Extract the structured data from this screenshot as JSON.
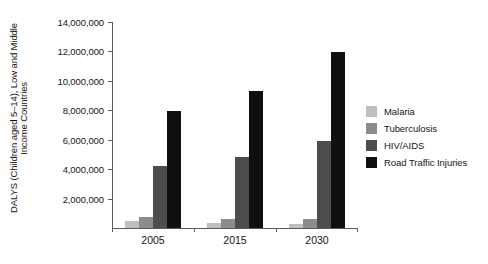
{
  "chart_data": {
    "type": "bar",
    "title": "",
    "xlabel": "",
    "ylabel_lines": [
      "DALYS (Children aged 5–14), Low and Middle",
      "Income Countries"
    ],
    "categories": [
      "2005",
      "2015",
      "2030"
    ],
    "series": [
      {
        "name": "Malaria",
        "color": "#bfbfbf",
        "values": [
          450000,
          330000,
          250000
        ]
      },
      {
        "name": "Tuberculosis",
        "color": "#8c8c8c",
        "values": [
          760000,
          640000,
          620000
        ]
      },
      {
        "name": "HIV/AIDS",
        "color": "#4d4d4d",
        "values": [
          4200000,
          4850000,
          5900000
        ]
      },
      {
        "name": "Road Traffic Injuries",
        "color": "#101010",
        "values": [
          7950000,
          9300000,
          11950000
        ]
      }
    ],
    "ylim": [
      0,
      14000000
    ],
    "ytick_values": [
      2000000,
      4000000,
      6000000,
      8000000,
      10000000,
      12000000,
      14000000
    ],
    "ytick_labels": [
      "2,000,000",
      "4,000,000",
      "6,000,000",
      "8,000,000",
      "10,000,000",
      "12,000,000",
      "14,000,000"
    ],
    "grid": false,
    "legend_position": "right",
    "legend_entries": [
      "Malaria",
      "Tuberculosis",
      "HIV/AIDS",
      "Road Traffic Injuries"
    ],
    "background_color": "#ffffff",
    "axis_color": "#5c5c5c"
  }
}
